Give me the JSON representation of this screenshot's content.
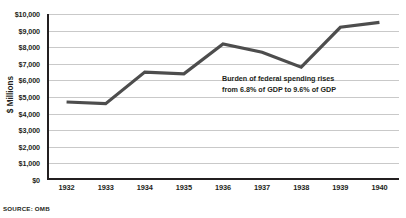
{
  "chart_data": {
    "type": "line",
    "title": "",
    "subtitle": "",
    "xlabel": "",
    "ylabel": "$ Millions",
    "categories": [
      "1932",
      "1933",
      "1934",
      "1935",
      "1936",
      "1937",
      "1938",
      "1939",
      "1940"
    ],
    "values": [
      4700,
      4600,
      6500,
      6400,
      8200,
      7700,
      6800,
      9200,
      9500
    ],
    "series": [
      {
        "name": "Federal spending",
        "values": [
          4700,
          4600,
          6500,
          6400,
          8200,
          7700,
          6800,
          9200,
          9500
        ]
      }
    ],
    "ylim": [
      0,
      10000
    ],
    "ytick_labels": [
      "$10,000",
      "$9,000",
      "$8,000",
      "$7,000",
      "$6,000",
      "$5,000",
      "$4,000",
      "$3,000",
      "$2,000",
      "$1,000",
      "$0"
    ],
    "ytick_values": [
      10000,
      9000,
      8000,
      7000,
      6000,
      5000,
      4000,
      3000,
      2000,
      1000,
      0
    ],
    "grid": "horizontal",
    "legend": "none",
    "line_color": "#4d4d4d",
    "grid_color": "#c9c9c9",
    "axis_color": "#231f20",
    "annotations": [
      {
        "line1": "Burden of federal spending rises",
        "line2": "from 6.8% of GDP to 9.6% of GDP"
      }
    ]
  },
  "footer": {
    "source": "SOURCE: OMB"
  }
}
